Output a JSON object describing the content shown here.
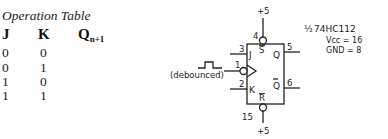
{
  "operation_table": {
    "title": "Operation Table",
    "headers": {
      "j": "J",
      "k": "K",
      "q_main": "Q",
      "q_sub": "n+1"
    },
    "rows": [
      {
        "j": "0",
        "k": "0"
      },
      {
        "j": "0",
        "k": "1"
      },
      {
        "j": "1",
        "k": "0"
      },
      {
        "j": "1",
        "k": "1"
      }
    ]
  },
  "flip_flop": {
    "chip_label_fraction": "½",
    "chip_label": "74HC112",
    "vcc_label": "Vcc = 16",
    "gnd_label": "GND = 8",
    "top_supply": "+5",
    "bottom_supply": "+5",
    "pins": {
      "set": {
        "number": "4",
        "label": "S"
      },
      "reset": {
        "number": "15",
        "label": "R"
      },
      "j": {
        "number": "3",
        "label": "J"
      },
      "clk": {
        "number": "1"
      },
      "k": {
        "number": "2",
        "label": "K"
      },
      "q": {
        "number": "5",
        "label": "Q"
      },
      "q_bar": {
        "number": "6",
        "label": "Q"
      }
    },
    "clock_input_note": "(debounced)"
  }
}
